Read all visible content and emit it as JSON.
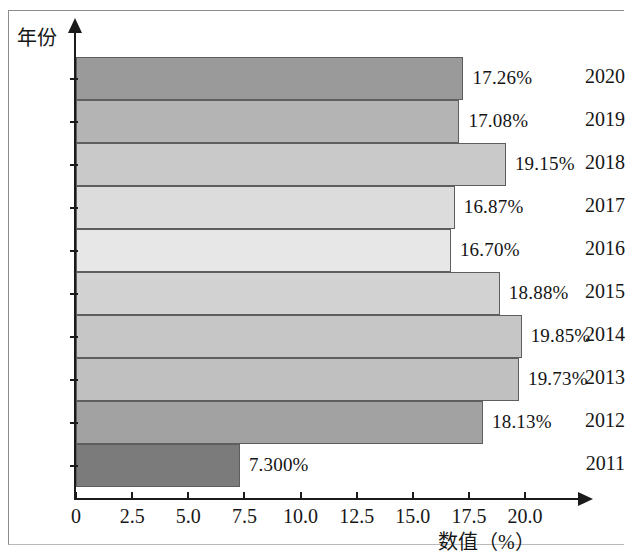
{
  "chart_data": {
    "type": "bar",
    "orientation": "horizontal",
    "title": "",
    "xlabel": "数值（%）",
    "ylabel": "年份",
    "categories": [
      "2020",
      "2019",
      "2018",
      "2017",
      "2016",
      "2015",
      "2014",
      "2013",
      "2012",
      "2011"
    ],
    "values": [
      17.26,
      17.08,
      19.15,
      16.87,
      16.7,
      18.88,
      19.85,
      19.73,
      18.13,
      7.3
    ],
    "value_labels": [
      "17.26%",
      "17.08%",
      "19.15%",
      "16.87%",
      "16.70%",
      "18.88%",
      "19.85%",
      "19.73%",
      "18.13%",
      "7.300%"
    ],
    "bar_colors": [
      "#9a9a9a",
      "#b4b4b4",
      "#c9c9c9",
      "#dcdcdc",
      "#e7e7e7",
      "#d2d2d2",
      "#c6c6c6",
      "#c0c0c0",
      "#a2a2a2",
      "#7b7b7b"
    ],
    "xlim": [
      0,
      20
    ],
    "xticks": [
      0,
      2.5,
      5.0,
      7.5,
      10.0,
      12.5,
      15.0,
      17.5,
      20.0
    ],
    "xtick_labels": [
      "0",
      "2.5",
      "5.0",
      "7.5",
      "10.0",
      "12.5",
      "15.0",
      "17.5",
      "20.0"
    ],
    "grid": false,
    "legend": false,
    "axis_color": "#1b1b1b",
    "bar_edge_color": "#5e5e5e",
    "background": "#ffffff"
  }
}
